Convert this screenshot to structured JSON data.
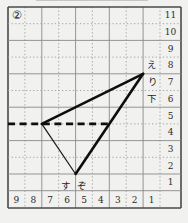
{
  "problem_number": "②",
  "axis": {
    "row_labels": [
      "11",
      "10",
      "9",
      "8",
      "7",
      "6",
      "5",
      "4",
      "3",
      "2",
      "1"
    ],
    "col_labels": [
      "9",
      "8",
      "7",
      "6",
      "5",
      "4",
      "3",
      "2",
      "1"
    ]
  },
  "point_labels": {
    "e": "え",
    "ri": "り",
    "shita": "下",
    "su": "す",
    "zo": "ぞ"
  },
  "figure": {
    "type": "triangle with dashed horizontal base line on grid paper",
    "grid_vertices": [
      {
        "desc": "apex near え/り labels",
        "col_line": "between 2 and 1",
        "row_line": "between 8 and 7"
      },
      {
        "desc": "left vertex on dashed line",
        "col_line": "between 8 and 7",
        "row_line": "between 5 and 4"
      },
      {
        "desc": "bottom vertex between す and ぞ",
        "col_line": "between 6 and 5",
        "row_line": "between 2 and 1"
      }
    ],
    "paths": {
      "side_top": "M143.1 73.8 L41.8 123.9",
      "side_right": "M143.1 73.8 L75.6 174",
      "side_left": "M41.8 123.9 L75.6 174",
      "dashed_base": "M8 123.9 L110.5 123.9"
    }
  },
  "colors": {
    "figure_line": "#0e0e0e",
    "grid_dotted": "#9d9d9d",
    "grid_border": "#4a4a4a",
    "paper": "#f1f1ef"
  }
}
